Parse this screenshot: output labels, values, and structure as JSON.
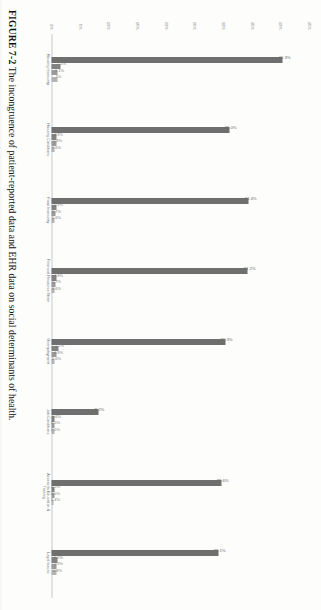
{
  "figure": {
    "number": "FIGURE 7-2",
    "caption": "The incongruence of patient-reported data and EHR data on social determinants of health."
  },
  "chart_data": {
    "type": "bar",
    "title": "",
    "xlabel": "",
    "ylabel": "",
    "ylim": [
      0,
      45
    ],
    "ytick_labels": [
      "0%",
      "5%",
      "10%",
      "15%",
      "20%",
      "25%",
      "30%",
      "35%",
      "40%",
      "45%"
    ],
    "ytick_values": [
      0,
      5,
      10,
      15,
      20,
      25,
      30,
      35,
      40,
      45
    ],
    "grid": false,
    "legend": "none",
    "categories": [
      "Housing Insecurity",
      "Housing Conditions",
      "Food Insecurity",
      "Financial Resource Strain",
      "Unemployment",
      "Job Conditions",
      "Access to Education & Training",
      "Legal Issues"
    ],
    "series": [
      {
        "name": "Patient-Reported",
        "values": [
          40.3,
          31.0,
          34.4,
          34.2,
          30.3,
          8.2,
          29.6,
          29.1
        ]
      },
      {
        "name": "EHR Structured",
        "values": [
          1.5,
          0.9,
          0.9,
          0.9,
          1.2,
          0.6,
          0.5,
          1.0
        ]
      },
      {
        "name": "EHR Coded",
        "values": [
          1.1,
          0.8,
          0.7,
          0.7,
          0.9,
          0.5,
          0.5,
          0.9
        ]
      },
      {
        "name": "EHR Notes",
        "values": [
          1.0,
          0.6,
          0.6,
          0.6,
          0.6,
          0.5,
          0.4,
          0.8
        ]
      }
    ],
    "groups": [
      {
        "category": "Housing Insecurity",
        "bars": [
          {
            "value": 40.3,
            "label": "40.3%",
            "shade": "primary"
          },
          {
            "value": 1.5,
            "label": "1.5%",
            "shade": "dark"
          },
          {
            "value": 1.1,
            "label": "1.1%",
            "shade": "mid"
          },
          {
            "value": 1.0,
            "label": "1%",
            "shade": "light"
          }
        ]
      },
      {
        "category": "Housing Conditions",
        "bars": [
          {
            "value": 31.0,
            "label": "31.0%",
            "shade": "primary"
          },
          {
            "value": 0.9,
            "label": "0.9%",
            "shade": "dark"
          },
          {
            "value": 0.8,
            "label": "0.8%",
            "shade": "mid"
          },
          {
            "value": 0.6,
            "label": "0.6%",
            "shade": "light"
          }
        ]
      },
      {
        "category": "Food Insecurity",
        "bars": [
          {
            "value": 34.4,
            "label": "34.4%",
            "shade": "primary"
          },
          {
            "value": 0.9,
            "label": "0.9%",
            "shade": "dark"
          },
          {
            "value": 0.7,
            "label": "0.7%",
            "shade": "mid"
          },
          {
            "value": 0.6,
            "label": "0.6%",
            "shade": "light"
          }
        ]
      },
      {
        "category": "Financial Resource Strain",
        "bars": [
          {
            "value": 34.2,
            "label": "34.2%",
            "shade": "primary"
          },
          {
            "value": 0.9,
            "label": "0.9%",
            "shade": "dark"
          },
          {
            "value": 0.7,
            "label": "0.7%",
            "shade": "mid"
          },
          {
            "value": 0.6,
            "label": "0.6%",
            "shade": "light"
          }
        ]
      },
      {
        "category": "Unemployment",
        "bars": [
          {
            "value": 30.3,
            "label": "30.3%",
            "shade": "primary"
          },
          {
            "value": 1.2,
            "label": "1.2%",
            "shade": "dark"
          },
          {
            "value": 0.9,
            "label": "0.9%",
            "shade": "mid"
          },
          {
            "value": 0.6,
            "label": "0.6%",
            "shade": "light"
          }
        ]
      },
      {
        "category": "Job Conditions",
        "bars": [
          {
            "value": 8.2,
            "label": "8.2%",
            "shade": "primary"
          },
          {
            "value": 0.6,
            "label": "0.6%",
            "shade": "dark"
          },
          {
            "value": 0.5,
            "label": "0.5%",
            "shade": "mid"
          },
          {
            "value": 0.5,
            "label": "0.5%",
            "shade": "light"
          }
        ]
      },
      {
        "category": "Access to Education & Training",
        "bars": [
          {
            "value": 29.6,
            "label": "29.6%",
            "shade": "primary"
          },
          {
            "value": 0.5,
            "label": "0.5%",
            "shade": "dark"
          },
          {
            "value": 0.5,
            "label": "0.5%",
            "shade": "mid"
          },
          {
            "value": 0.4,
            "label": "0.4%",
            "shade": "light"
          }
        ]
      },
      {
        "category": "Legal Issues",
        "bars": [
          {
            "value": 29.1,
            "label": "29.1%",
            "shade": "primary"
          },
          {
            "value": 1.0,
            "label": "1.0%",
            "shade": "dark"
          },
          {
            "value": 0.9,
            "label": "0.9%",
            "shade": "mid"
          },
          {
            "value": 0.8,
            "label": "0.8%",
            "shade": "light"
          }
        ]
      }
    ],
    "colors": {
      "primary": "#6f6f6f",
      "dark": "#828282",
      "mid": "#9a9a9a",
      "light": "#b4b4b4",
      "axis": "#c9c9c9",
      "text": "#6f6f6f"
    }
  }
}
